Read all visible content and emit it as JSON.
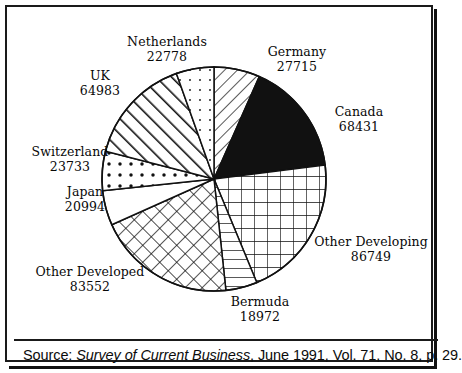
{
  "chart_data": {
    "type": "pie",
    "title": "",
    "categories": [
      "Germany",
      "Canada",
      "Other Developing",
      "Bermuda",
      "Other Developed",
      "Japan",
      "Switzerland",
      "UK",
      "Netherlands"
    ],
    "values": [
      27715,
      68431,
      86749,
      18972,
      83552,
      20994,
      23733,
      64983,
      22778
    ],
    "total": 417907,
    "start_angle_deg": 0,
    "direction": "clockwise",
    "legend": "none (direct labels)",
    "slice_patterns": [
      "diagonal-hatch-thin",
      "solid-black",
      "grid-square",
      "horizontal-lines",
      "diagonal-crosshatch",
      "blank-white",
      "dots-coarse",
      "diagonal-lines-thick",
      "dots-sparse"
    ],
    "slices": [
      {
        "label": "Germany",
        "value": 27715,
        "pattern": "diagonal-hatch-thin"
      },
      {
        "label": "Canada",
        "value": 68431,
        "pattern": "solid-black"
      },
      {
        "label": "Other Developing",
        "value": 86749,
        "pattern": "grid-square"
      },
      {
        "label": "Bermuda",
        "value": 18972,
        "pattern": "horizontal-lines"
      },
      {
        "label": "Other Developed",
        "value": 83552,
        "pattern": "diagonal-crosshatch"
      },
      {
        "label": "Japan",
        "value": 20994,
        "pattern": "blank-white"
      },
      {
        "label": "Switzerland",
        "value": 23733,
        "pattern": "dots-coarse"
      },
      {
        "label": "UK",
        "value": 64983,
        "pattern": "diagonal-lines-thick"
      },
      {
        "label": "Netherlands",
        "value": 22778,
        "pattern": "dots-sparse"
      }
    ]
  },
  "labels": {
    "netherlands": {
      "name": "Netherlands",
      "value": "22778"
    },
    "germany": {
      "name": "Germany",
      "value": "27715"
    },
    "uk": {
      "name": "UK",
      "value": "64983"
    },
    "canada": {
      "name": "Canada",
      "value": "68431"
    },
    "switzerland": {
      "name": "Switzerland",
      "value": "23733"
    },
    "japan": {
      "name": "Japan",
      "value": "20994"
    },
    "other_developed": {
      "name": "Other Developed",
      "value": "83552"
    },
    "bermuda": {
      "name": "Bermuda",
      "value": "18972"
    },
    "other_developing": {
      "name": "Other Developing",
      "value": "86749"
    }
  },
  "source": {
    "prefix": "Source: ",
    "publication": "Survey of Current Business",
    "suffix": ", June 1991, Vol. 71, No. 8, p. 29."
  },
  "colors": {
    "ink": "#111111",
    "paper": "#ffffff"
  }
}
